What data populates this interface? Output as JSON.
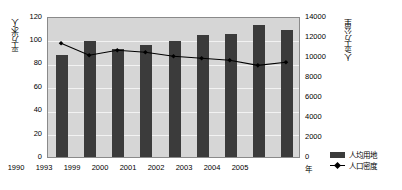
{
  "chart_data": {
    "type": "bar",
    "title": "",
    "categories": [
      "1990",
      "1993",
      "1999",
      "2000",
      "2001",
      "2002",
      "2003",
      "2004",
      "2005"
    ],
    "xlabel": "年",
    "series": [
      {
        "name": "人均用地",
        "type": "bar",
        "axis": "left",
        "values": [
          87,
          99,
          92,
          95,
          99,
          104,
          105,
          112,
          108
        ]
      },
      {
        "name": "人口密度",
        "type": "line",
        "axis": "right",
        "values": [
          11400,
          10200,
          10700,
          10500,
          10100,
          9900,
          9700,
          9200,
          9500
        ]
      }
    ],
    "left_axis": {
      "label": "平方米/人",
      "ticks": [
        "0",
        "20",
        "40",
        "60",
        "80",
        "100",
        "120"
      ],
      "min": 0,
      "max": 120,
      "step": 20
    },
    "right_axis": {
      "label": "人/平方公里",
      "ticks": [
        "0",
        "2000",
        "4000",
        "6000",
        "8000",
        "10000",
        "12000",
        "14000"
      ],
      "min": 0,
      "max": 14000,
      "step": 2000
    },
    "legend": {
      "position": "bottom-right",
      "entries": [
        {
          "label": "人均用地",
          "marker": "bar",
          "color": "#3b3b3b"
        },
        {
          "label": "人口密度",
          "marker": "line-diamond",
          "color": "#000000"
        }
      ]
    },
    "grid": true,
    "plot_background": "#d6d6d6"
  }
}
